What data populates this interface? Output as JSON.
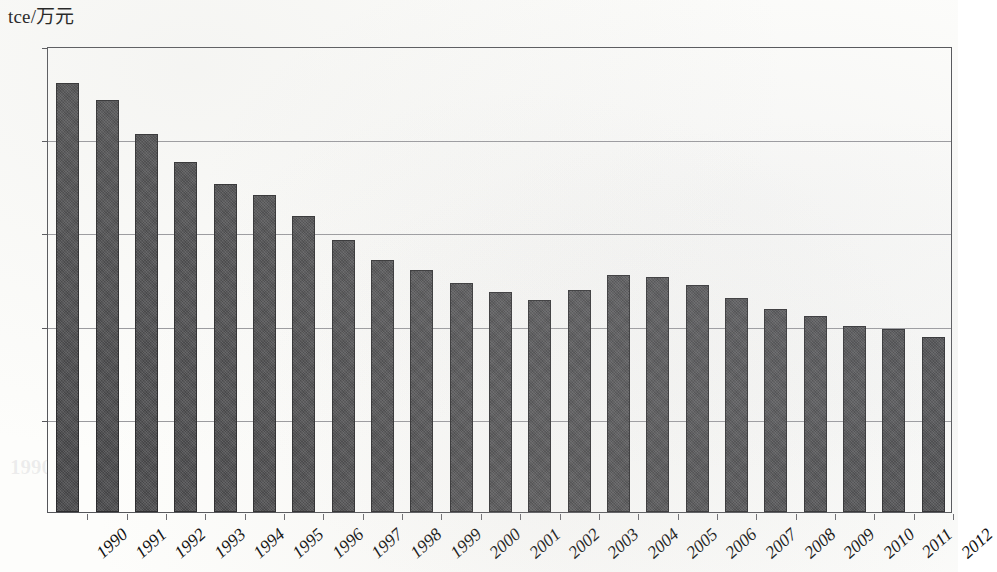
{
  "chart_data": {
    "type": "bar",
    "title": "",
    "subtitle": "",
    "xlabel": "",
    "ylabel": "tce/万元",
    "ylim": [
      0,
      2.5
    ],
    "ytick_labels": [
      "0",
      "0.5",
      "1",
      "1.5",
      "2",
      "2.5"
    ],
    "ytick_values": [
      0,
      0.5,
      1,
      1.5,
      2,
      2.5
    ],
    "grid": true,
    "legend": false,
    "legend_position": "none",
    "bar_color": "#4b4b4d",
    "categories": [
      "1990",
      "1991",
      "1992",
      "1993",
      "1994",
      "1995",
      "1996",
      "1997",
      "1998",
      "1999",
      "2000",
      "2001",
      "2002",
      "2003",
      "2004",
      "2005",
      "2006",
      "2007",
      "2008",
      "2009",
      "2010",
      "2011",
      "2012"
    ],
    "values": [
      2.3,
      2.21,
      2.03,
      1.88,
      1.76,
      1.7,
      1.59,
      1.46,
      1.35,
      1.3,
      1.23,
      1.18,
      1.14,
      1.19,
      1.27,
      1.26,
      1.22,
      1.15,
      1.09,
      1.05,
      1.0,
      0.98,
      0.94
    ],
    "annotations": []
  },
  "axis": {
    "y_unit_caption": "tce/万元"
  },
  "ghosts": [
    {
      "text": "2005",
      "x": 760,
      "y": 70
    },
    {
      "text": "2002",
      "x": 455,
      "y": 262
    },
    {
      "text": "2006",
      "x": 700,
      "y": 272
    },
    {
      "text": "2008",
      "x": 855,
      "y": 272
    },
    {
      "text": "2008",
      "x": 700,
      "y": 278
    },
    {
      "text": "2009",
      "x": 790,
      "y": 285
    },
    {
      "text": "1990",
      "x": 10,
      "y": 455
    }
  ]
}
